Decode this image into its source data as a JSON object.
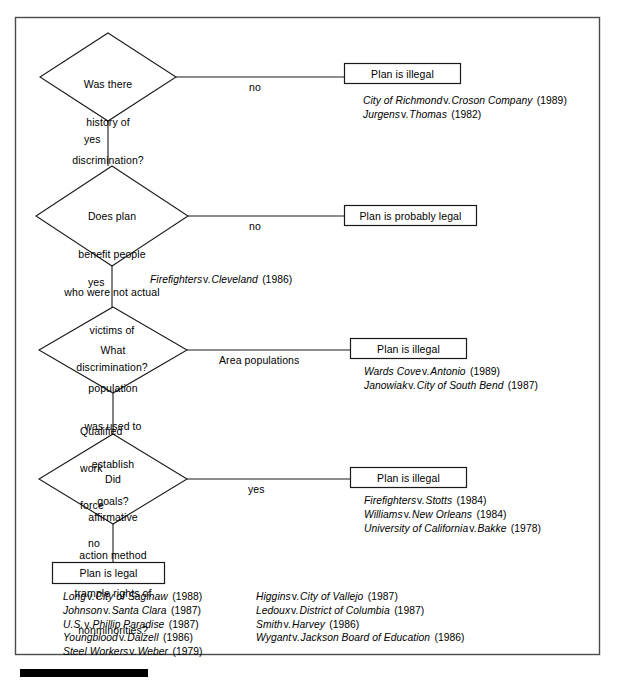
{
  "figure": {
    "type": "decision-flowchart",
    "frame_color": "#3a3a3a",
    "ink_color": "#000000",
    "background": "#ffffff"
  },
  "nodes": {
    "q1": {
      "shape": "diamond",
      "lines": [
        "Was there",
        "history of",
        "discrimination?"
      ]
    },
    "q2": {
      "shape": "diamond",
      "lines": [
        "Does plan",
        "benefit people",
        "who were not actual",
        "victims of",
        "discrimination?"
      ]
    },
    "q3": {
      "shape": "diamond",
      "lines": [
        "What",
        "population",
        "was used to",
        "establish",
        "goals?"
      ]
    },
    "q4": {
      "shape": "diamond",
      "lines": [
        "Did",
        "affirmative",
        "action method",
        "trample rights of",
        "nonminorities?"
      ]
    },
    "r1": {
      "shape": "box",
      "label": "Plan is illegal"
    },
    "r2": {
      "shape": "box",
      "label": "Plan is probably legal"
    },
    "r3": {
      "shape": "box",
      "label": "Plan is illegal"
    },
    "r4": {
      "shape": "box",
      "label": "Plan is illegal"
    },
    "r5": {
      "shape": "box",
      "label": "Plan is legal"
    }
  },
  "edges": {
    "e1_no": "no",
    "e1_yes": "yes",
    "e2_no": "no",
    "e2_yes": "yes",
    "e3_area": "Area populations",
    "e3_qualified": [
      "Qualified",
      "work",
      "force"
    ],
    "e4_yes": "yes",
    "e4_no": "no"
  },
  "citations": {
    "after_q1_no": [
      {
        "party1": "City of Richmond",
        "v": "v.",
        "party2": "Croson Company",
        "year": "(1989)"
      },
      {
        "party1": "Jurgens",
        "v": "v.",
        "party2": "Thomas",
        "year": "(1982)"
      }
    ],
    "after_q2_yes": [
      {
        "party1": "Firefighters",
        "v": "v.",
        "party2": "Cleveland",
        "year": "(1986)"
      }
    ],
    "after_q3_area": [
      {
        "party1": "Wards Cove",
        "v": "v.",
        "party2": "Antonio",
        "year": "(1989)"
      },
      {
        "party1": "Janowiak",
        "v": "v.",
        "party2": "City of South Bend",
        "year": "(1987)"
      }
    ],
    "after_q4_yes": [
      {
        "party1": "Firefighters",
        "v": "v.",
        "party2": "Stotts",
        "year": "(1984)"
      },
      {
        "party1": "Williams",
        "v": "v.",
        "party2": "New Orleans",
        "year": "(1984)"
      },
      {
        "party1": "University of California",
        "v": "v.",
        "party2": "Bakke",
        "year": "(1978)"
      }
    ],
    "legal_column_left": [
      {
        "party1": "Long",
        "v": "v.",
        "party2": "City of Saginaw",
        "year": "(1988)"
      },
      {
        "party1": "Johnson",
        "v": "v.",
        "party2": "Santa Clara",
        "year": "(1987)"
      },
      {
        "party1": "U.S.",
        "v": "v.",
        "party2": "Phillip Paradise",
        "year": "(1987)"
      },
      {
        "party1": "Youngblood",
        "v": "v.",
        "party2": "Dalzell",
        "year": "(1986)"
      },
      {
        "party1": "Steel Workers",
        "v": "v.",
        "party2": "Weber",
        "year": "(1979)"
      }
    ],
    "legal_column_right": [
      {
        "party1": "Higgins",
        "v": "v.",
        "party2": "City of Vallejo",
        "year": "(1987)"
      },
      {
        "party1": "Ledoux",
        "v": "v.",
        "party2": "District of Columbia",
        "year": "(1987)"
      },
      {
        "party1": "Smith",
        "v": "v.",
        "party2": "Harvey",
        "year": "(1986)"
      },
      {
        "party1": "Wygant",
        "v": "v.",
        "party2": "Jackson Board of Education",
        "year": "(1986)"
      }
    ]
  },
  "footer_bar": {
    "name": "black-rule",
    "color": "#000000"
  }
}
